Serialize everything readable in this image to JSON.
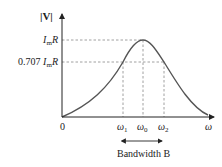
{
  "diagram": {
    "y_axis_label": "|V|",
    "x_axis_label": "ω",
    "origin_label": "0",
    "levels": {
      "peak": {
        "coef": "",
        "sym": "I",
        "sub": "m",
        "tail": "R"
      },
      "half_power": {
        "coef": "0.707 ",
        "sym": "I",
        "sub": "m",
        "tail": "R"
      }
    },
    "frequencies": [
      {
        "sym": "ω",
        "sub": "1"
      },
      {
        "sym": "ω",
        "sub": "0"
      },
      {
        "sym": "ω",
        "sub": "2"
      }
    ],
    "bandwidth_label": "Bandwidth B",
    "colors": {
      "axis": "#222222",
      "curve": "#555555",
      "guide": "#888888",
      "text": "#222222"
    }
  }
}
